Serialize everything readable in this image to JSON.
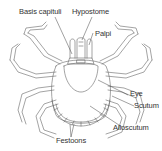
{
  "diagram": {
    "line_color": "#555555",
    "label_color": "#333333",
    "background": "#ffffff",
    "labels": [
      {
        "id": "basis-capituli",
        "text": "Basis capituli"
      },
      {
        "id": "hypostome",
        "text": "Hypostome"
      },
      {
        "id": "palpi",
        "text": "Palpi"
      },
      {
        "id": "eye",
        "text": "Eye"
      },
      {
        "id": "scutum",
        "text": "Scutum"
      },
      {
        "id": "alloscutum",
        "text": "Alloscutum"
      },
      {
        "id": "festoons",
        "text": "Festoons"
      }
    ]
  }
}
